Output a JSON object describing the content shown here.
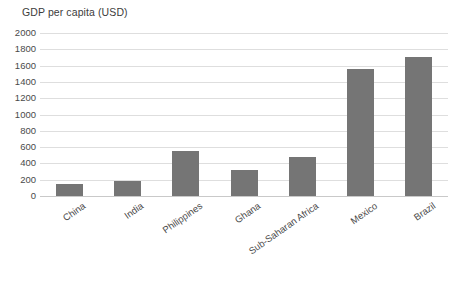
{
  "chart_data": {
    "type": "bar",
    "title": "GDP per capita (USD)",
    "xlabel": "",
    "ylabel": "",
    "categories": [
      "China",
      "India",
      "Philippines",
      "Ghana",
      "Sub-Saharan Africa",
      "Mexico",
      "Brazil"
    ],
    "values": [
      150,
      190,
      550,
      320,
      480,
      1560,
      1700
    ],
    "ylim": [
      0,
      2000
    ],
    "yticks": [
      0,
      200,
      400,
      600,
      800,
      1000,
      1200,
      1400,
      1600,
      1800,
      2000
    ],
    "ytick_labels": [
      "0",
      "200",
      "400",
      "600",
      "800",
      "1000",
      "1200",
      "1400",
      "1600",
      "1800",
      "2000"
    ],
    "grid": true,
    "legend": false,
    "bar_color": "#757575",
    "grid_color": "#dedede",
    "axis_color": "#c9c9c9",
    "background_color": "#ffffff"
  }
}
